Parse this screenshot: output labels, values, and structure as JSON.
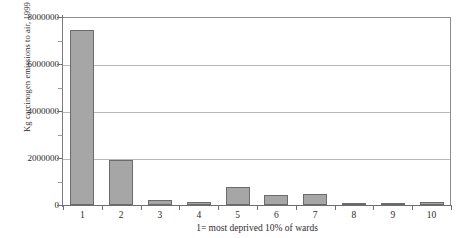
{
  "chart_data": {
    "type": "bar",
    "title": "",
    "xlabel": "1= most deprived 10% of wards",
    "ylabel": "Kg carcinogen emissions to air, 1999",
    "categories": [
      "1",
      "2",
      "3",
      "4",
      "5",
      "6",
      "7",
      "8",
      "9",
      "10"
    ],
    "values": [
      7450000,
      1900000,
      210000,
      120000,
      780000,
      430000,
      480000,
      80000,
      60000,
      130000
    ],
    "series": [
      {
        "name": "Kg carcinogen emissions to air, 1999",
        "values": [
          7450000,
          1900000,
          210000,
          120000,
          780000,
          430000,
          480000,
          80000,
          60000,
          130000
        ]
      }
    ],
    "ylim": [
      0,
      8000000
    ],
    "ytick_labels": [
      "8000000",
      "6000000",
      "4000000",
      "2000000",
      "0"
    ],
    "ytick_values": [
      8000000,
      6000000,
      4000000,
      2000000,
      0
    ],
    "yminor_values": [
      7000000,
      5000000,
      3000000,
      1000000
    ],
    "grid": "horizontal-major",
    "legend": "none",
    "bar_color": "#a6a6a6",
    "bar_border_color": "#6b6b6b",
    "gridline_color": "#b9b9b9",
    "axis_color": "#6e6e6e"
  },
  "figure": {
    "cropped_title": "",
    "background": "#ffffff"
  }
}
